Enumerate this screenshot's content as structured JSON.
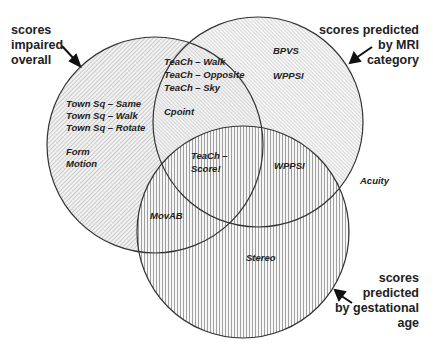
{
  "diagram": {
    "type": "venn",
    "sets": [
      {
        "id": "A",
        "caption": "scores\nimpaired\noverall",
        "cx": 155,
        "cy": 145,
        "r": 108,
        "pattern": "diagonal-hatch"
      },
      {
        "id": "B",
        "caption": "scores predicted\nby MRI\ncategory",
        "cx": 258,
        "cy": 122,
        "r": 105,
        "pattern": "diagonal-hatch-fine"
      },
      {
        "id": "C",
        "caption": "scores\npredicted\nby gestational\nage",
        "cx": 243,
        "cy": 232,
        "r": 106,
        "pattern": "vertical-lines"
      }
    ],
    "regions": {
      "A_only": [
        "Town Sq – Same",
        "Town Sq – Walk",
        "Town Sq – Rotate",
        "",
        "Form",
        "Motion"
      ],
      "A_and_B": [
        "TeaCh – Walk",
        "TeaCh – Opposite",
        "TeaCh – Sky",
        "",
        "Cpoint"
      ],
      "A_B_C": [
        "TeaCh –",
        "Score!"
      ],
      "A_and_C": [
        "MovAB"
      ],
      "B_only": [
        "BPVS",
        "",
        "WPPSI"
      ],
      "B_and_C": [
        "WPPSI"
      ],
      "C_only": [
        "Stereo"
      ],
      "outside": [
        "Acuity"
      ]
    }
  }
}
